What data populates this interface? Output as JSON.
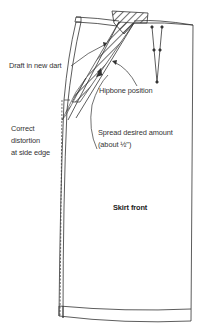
{
  "diagram": {
    "stroke_color": "#333333",
    "background": "#ffffff",
    "labels": {
      "draft_new_dart": "Draft in new dart",
      "hipbone_position": "Hipbone position",
      "correct_distortion_line1": "Correct",
      "correct_distortion_line2": "distortion",
      "correct_distortion_line3": "at side edge",
      "spread_line1": "Spread desired amount",
      "spread_line2": "(about ½\")",
      "skirt_front": "Skirt front"
    }
  }
}
